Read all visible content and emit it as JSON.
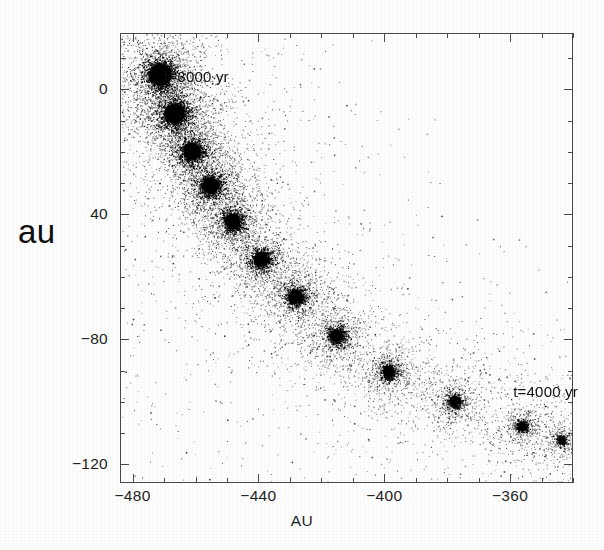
{
  "figure": {
    "title": "",
    "background_color": "#ffffff",
    "point_color": "#000000",
    "frame_color": "#4a4a4a"
  },
  "axes": {
    "x_label": "AU",
    "y_label": "au",
    "x_ticks": [
      {
        "value": -480,
        "label": "−480"
      },
      {
        "value": -440,
        "label": "−440"
      },
      {
        "value": -400,
        "label": "−400"
      },
      {
        "value": -360,
        "label": "−360"
      }
    ],
    "y_ticks": [
      {
        "value": 0,
        "label": "0"
      },
      {
        "value": -40,
        "label": "40"
      },
      {
        "value": -80,
        "label": "−80"
      },
      {
        "value": -120,
        "label": "−120"
      }
    ],
    "x_minor_step": 10,
    "y_minor_step": 10,
    "xlim": [
      -484,
      -340
    ],
    "ylim": [
      -126,
      18
    ],
    "y_inverted": true,
    "grid": false
  },
  "annotations": [
    {
      "name": "t-3000-label",
      "text": "t=3000 yr",
      "x": -470,
      "y": 4
    },
    {
      "name": "t-4000-label",
      "text": "t=4000 yr",
      "x": -359,
      "y": -97
    }
  ],
  "chart_data": {
    "type": "scatter",
    "title": "",
    "xlabel": "AU",
    "ylabel": "au",
    "xlim": [
      -484,
      -340
    ],
    "ylim": [
      -126,
      18
    ],
    "y_inverted": true,
    "grid": false,
    "legend": null,
    "series": [
      {
        "name": "clumps",
        "marker": "dense-point-cluster",
        "color": "#000000",
        "points": [
          {
            "x": -471.5,
            "y": 5.0,
            "radius_au": 5.6,
            "n_points": 1500,
            "density": 1.0
          },
          {
            "x": -467.0,
            "y": -7.5,
            "radius_au": 5.2,
            "n_points": 1380,
            "density": 0.97
          },
          {
            "x": -461.5,
            "y": -19.5,
            "radius_au": 4.4,
            "n_points": 1120,
            "density": 0.94
          },
          {
            "x": -455.5,
            "y": -30.5,
            "radius_au": 4.2,
            "n_points": 1040,
            "density": 0.92
          },
          {
            "x": -448.5,
            "y": -42.0,
            "radius_au": 3.9,
            "n_points": 950,
            "density": 0.9
          },
          {
            "x": -439.5,
            "y": -54.0,
            "radius_au": 3.6,
            "n_points": 860,
            "density": 0.88
          },
          {
            "x": -428.5,
            "y": -66.0,
            "radius_au": 3.4,
            "n_points": 790,
            "density": 0.86
          },
          {
            "x": -415.5,
            "y": -78.5,
            "radius_au": 3.1,
            "n_points": 700,
            "density": 0.83
          },
          {
            "x": -399.0,
            "y": -90.0,
            "radius_au": 2.8,
            "n_points": 600,
            "density": 0.8
          },
          {
            "x": -378.0,
            "y": -99.5,
            "radius_au": 2.4,
            "n_points": 480,
            "density": 0.76
          },
          {
            "x": -356.5,
            "y": -107.5,
            "radius_au": 2.0,
            "n_points": 360,
            "density": 0.7
          },
          {
            "x": -344.0,
            "y": -112.0,
            "radius_au": 1.6,
            "n_points": 250,
            "density": 0.62
          }
        ]
      },
      {
        "name": "diffuse-halo",
        "marker": "sparse-point-scatter",
        "color": "#000000",
        "n_points": 5200,
        "note": "Broad envelope of low-density particles filling the frame, densest along the clump chain and toward the upper-left corner, thinning toward the upper-right."
      }
    ]
  }
}
